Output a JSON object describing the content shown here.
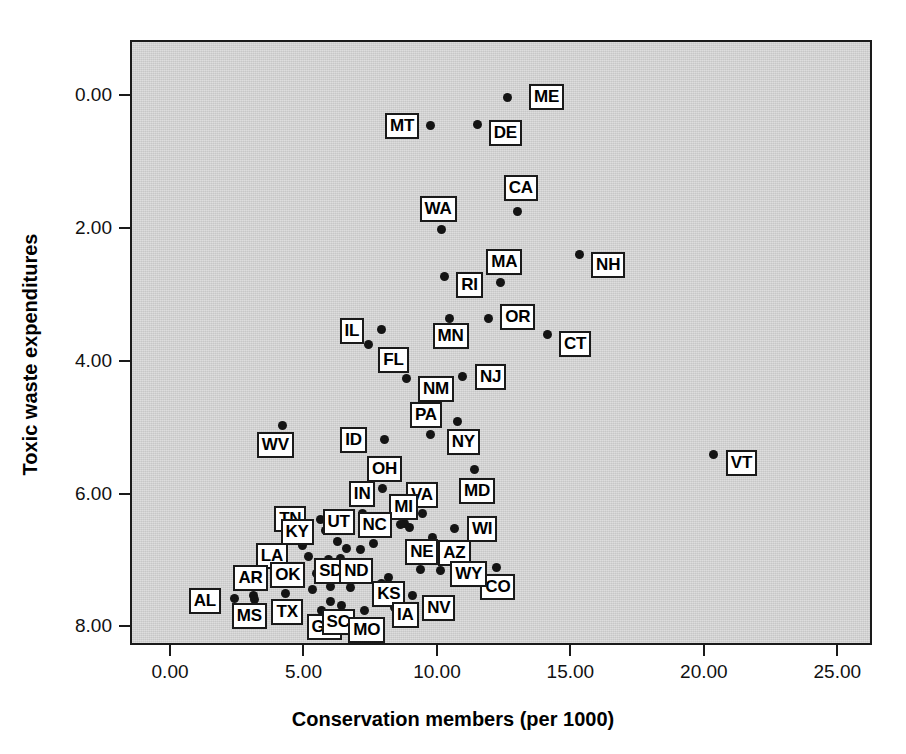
{
  "chart_data": {
    "type": "scatter",
    "title": "",
    "xlabel": "Conservation members (per 1000)",
    "ylabel": "Toxic waste expenditures",
    "xlim": [
      -1.5,
      26.3
    ],
    "ylim": [
      -0.28,
      8.83
    ],
    "xticks": [
      0,
      5,
      10,
      15,
      20,
      25
    ],
    "xticklabels": [
      "0.00",
      "5.00",
      "10.00",
      "15.00",
      "20.00",
      "25.00"
    ],
    "yticks": [
      0,
      2,
      4,
      6,
      8
    ],
    "yticklabels": [
      "0.00",
      "2.00",
      "4.00",
      "6.00",
      "8.00"
    ],
    "grid": false,
    "legend": null,
    "plot_background": "#d2d2d2",
    "point_color": "#141414",
    "label_box_fill": "#ffffff",
    "label_box_border": "#1a1a1a",
    "points": [
      {
        "label": "ME",
        "x": 12.55,
        "y": 8.0,
        "lx": 22,
        "ly": -13
      },
      {
        "label": "MT",
        "x": 9.7,
        "y": 7.57,
        "lx": -46,
        "ly": -13
      },
      {
        "label": "DE",
        "x": 11.45,
        "y": 7.59,
        "lx": 11,
        "ly": -4
      },
      {
        "label": "CA",
        "x": 12.95,
        "y": 6.28,
        "lx": -14,
        "ly": -36
      },
      {
        "label": "WA",
        "x": 10.1,
        "y": 6.0,
        "lx": -22,
        "ly": -34
      },
      {
        "label": "NH",
        "x": 15.25,
        "y": 5.63,
        "lx": 12,
        "ly": -3
      },
      {
        "label": "RI",
        "x": 10.2,
        "y": 5.3,
        "lx": 12,
        "ly": -4
      },
      {
        "label": "MA",
        "x": 12.3,
        "y": 5.21,
        "lx": -14,
        "ly": -33
      },
      {
        "label": "OR",
        "x": 11.85,
        "y": 4.67,
        "lx": 12,
        "ly": -14
      },
      {
        "label": "MN",
        "x": 10.4,
        "y": 4.66,
        "lx": -17,
        "ly": 4
      },
      {
        "label": "IL",
        "x": 7.85,
        "y": 4.5,
        "lx": -42,
        "ly": -12
      },
      {
        "label": "CT",
        "x": 14.05,
        "y": 4.42,
        "lx": 12,
        "ly": -4
      },
      {
        "label": "FL",
        "x": 7.35,
        "y": 4.27,
        "lx": 10,
        "ly": 2
      },
      {
        "label": "NJ",
        "x": 10.9,
        "y": 3.79,
        "lx": 12,
        "ly": -13
      },
      {
        "label": "NM",
        "x": 8.8,
        "y": 3.76,
        "lx": 11,
        "ly": -3
      },
      {
        "label": "NY",
        "x": 10.7,
        "y": 3.12,
        "lx": -11,
        "ly": 8
      },
      {
        "label": "PA",
        "x": 9.7,
        "y": 2.92,
        "lx": -21,
        "ly": -32
      },
      {
        "label": "ID",
        "x": 7.95,
        "y": 2.85,
        "lx": -44,
        "ly": -12
      },
      {
        "label": "WV",
        "x": 4.15,
        "y": 3.05,
        "lx": -26,
        "ly": 6
      },
      {
        "label": "VT",
        "x": 20.3,
        "y": 2.62,
        "lx": 12,
        "ly": -4
      },
      {
        "label": "MD",
        "x": 11.35,
        "y": 2.39,
        "lx": -16,
        "ly": 8
      },
      {
        "label": "OH",
        "x": 7.9,
        "y": 2.1,
        "lx": -16,
        "ly": -33
      },
      {
        "label": "VA",
        "x": 9.4,
        "y": 1.73,
        "lx": -17,
        "ly": -32
      },
      {
        "label": "IN",
        "x": 7.15,
        "y": 1.73,
        "lx": -14,
        "ly": -33
      },
      {
        "label": "TN",
        "x": 5.55,
        "y": 1.64,
        "lx": -46,
        "ly": -13
      },
      {
        "label": "MI",
        "x": 8.7,
        "y": 1.58,
        "lx": -15,
        "ly": -29
      },
      {
        "label": "WI",
        "x": 10.6,
        "y": 1.5,
        "lx": 12,
        "ly": -13
      },
      {
        "label": "KY",
        "x": 5.75,
        "y": 1.47,
        "lx": -45,
        "ly": -12
      },
      {
        "label": "UT",
        "x": 6.2,
        "y": 1.31,
        "lx": -15,
        "ly": -32
      },
      {
        "label": "AZ",
        "x": 9.75,
        "y": 1.37,
        "lx": 6,
        "ly": 3
      },
      {
        "label": "NC",
        "x": 7.55,
        "y": 1.28,
        "lx": -16,
        "ly": -31
      },
      {
        "label": "LA",
        "x": 4.9,
        "y": 1.25,
        "lx": -47,
        "ly": -2
      },
      {
        "label": "CO",
        "x": 12.15,
        "y": 0.92,
        "lx": -16,
        "ly": 7
      },
      {
        "label": "SD",
        "x": 5.85,
        "y": 1.04,
        "lx": -14,
        "ly": -1
      },
      {
        "label": "ND",
        "x": 6.3,
        "y": 1.05,
        "lx": -1,
        "ly": -1
      },
      {
        "label": "NE",
        "x": 9.3,
        "y": 0.89,
        "lx": -15,
        "ly": -30
      },
      {
        "label": "OK",
        "x": 5.4,
        "y": 0.82,
        "lx": -46,
        "ly": -12
      },
      {
        "label": "WY",
        "x": 10.05,
        "y": 0.87,
        "lx": 10,
        "ly": -10
      },
      {
        "label": "KS",
        "x": 8.1,
        "y": 0.76,
        "lx": -16,
        "ly": 3
      },
      {
        "label": "AR",
        "x": 3.05,
        "y": 0.49,
        "lx": -20,
        "ly": -31
      },
      {
        "label": "MS",
        "x": 3.1,
        "y": 0.43,
        "lx": -23,
        "ly": 3
      },
      {
        "label": "AL",
        "x": 2.35,
        "y": 0.45,
        "lx": -46,
        "ly": -11
      },
      {
        "label": "NV",
        "x": 9.0,
        "y": 0.49,
        "lx": 10,
        "ly": -1
      },
      {
        "label": "TX",
        "x": 4.25,
        "y": 0.52,
        "lx": -14,
        "ly": 5
      },
      {
        "label": "IA",
        "x": 8.35,
        "y": 0.32,
        "lx": -3,
        "ly": -5
      },
      {
        "label": "GA",
        "x": 5.6,
        "y": 0.27,
        "lx": -15,
        "ly": 4
      },
      {
        "label": "SC",
        "x": 6.35,
        "y": 0.34,
        "lx": -20,
        "ly": 3
      },
      {
        "label": "MO",
        "x": 7.2,
        "y": 0.27,
        "lx": -16,
        "ly": 7
      },
      {
        "label": "p1",
        "x": 6.55,
        "y": 1.2,
        "lx": null,
        "ly": null
      },
      {
        "label": "p2",
        "x": 7.05,
        "y": 1.19,
        "lx": null,
        "ly": null
      },
      {
        "label": "p3",
        "x": 8.55,
        "y": 1.56,
        "lx": null,
        "ly": null
      },
      {
        "label": "p4",
        "x": 8.9,
        "y": 1.52,
        "lx": null,
        "ly": null
      },
      {
        "label": "p5",
        "x": 5.1,
        "y": 1.09,
        "lx": null,
        "ly": null
      },
      {
        "label": "p6",
        "x": 5.95,
        "y": 0.86,
        "lx": null,
        "ly": null
      },
      {
        "label": "p7",
        "x": 6.2,
        "y": 0.85,
        "lx": null,
        "ly": null
      },
      {
        "label": "p8",
        "x": 6.5,
        "y": 0.84,
        "lx": null,
        "ly": null
      },
      {
        "label": "p9",
        "x": 7.3,
        "y": 0.81,
        "lx": null,
        "ly": null
      },
      {
        "label": "p10",
        "x": 5.95,
        "y": 0.63,
        "lx": null,
        "ly": null
      },
      {
        "label": "p11",
        "x": 6.7,
        "y": 0.62,
        "lx": null,
        "ly": null
      },
      {
        "label": "p12",
        "x": 7.85,
        "y": 0.68,
        "lx": null,
        "ly": null
      },
      {
        "label": "p13",
        "x": 8.0,
        "y": 0.64,
        "lx": null,
        "ly": null
      },
      {
        "label": "p14",
        "x": 5.25,
        "y": 0.58,
        "lx": null,
        "ly": null
      },
      {
        "label": "p15",
        "x": 5.95,
        "y": 0.41,
        "lx": null,
        "ly": null
      },
      {
        "label": "p16",
        "x": 4.75,
        "y": 0.36,
        "lx": null,
        "ly": null
      },
      {
        "label": "p17",
        "x": 8.5,
        "y": 0.52,
        "lx": null,
        "ly": null
      }
    ]
  },
  "axes": {
    "xlabel": "Conservation members (per 1000)",
    "ylabel": "Toxic waste expenditures",
    "xticklabels": [
      "0.00",
      "5.00",
      "10.00",
      "15.00",
      "20.00",
      "25.00"
    ],
    "yticklabels": [
      "8.00",
      "6.00",
      "4.00",
      "2.00",
      "0.00"
    ]
  }
}
